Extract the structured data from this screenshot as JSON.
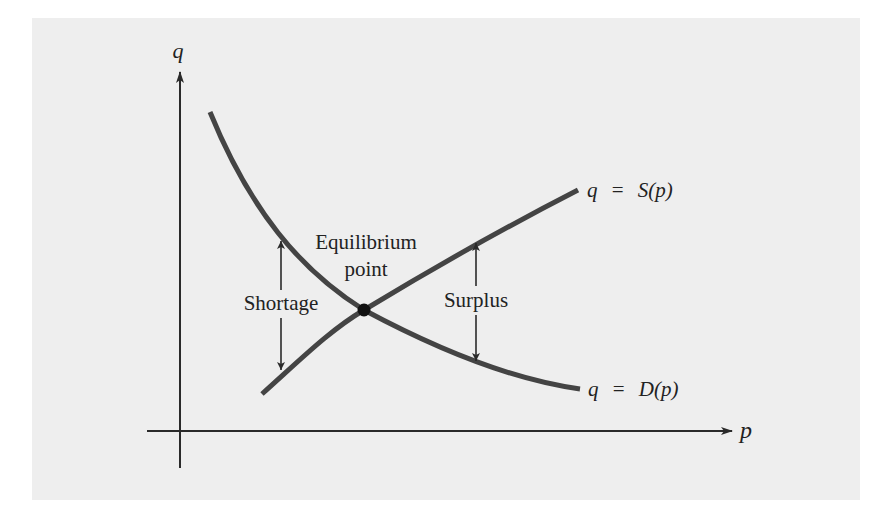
{
  "figure": {
    "background_color": "#eeeeee",
    "ink_color": "#2a2a2a",
    "curve_color": "#444444",
    "axes": {
      "x_label": "p",
      "y_label": "q"
    },
    "curves": {
      "supply": {
        "label_lhs": "q",
        "label_eq": "=",
        "label_rhs_func": "S",
        "label_rhs_arg": "(p)",
        "full_label": "q = S(p)"
      },
      "demand": {
        "label_lhs": "q",
        "label_eq": "=",
        "label_rhs_func": "D",
        "label_rhs_arg": "(p)",
        "full_label": "q = D(p)"
      }
    },
    "annotations": {
      "equilibrium_line1": "Equilibrium",
      "equilibrium_line2": "point",
      "shortage": "Shortage",
      "surplus": "Surplus"
    }
  }
}
